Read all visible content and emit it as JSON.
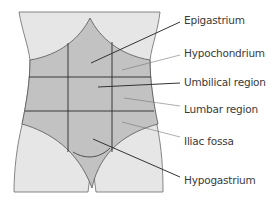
{
  "diagram": {
    "colors": {
      "background": "#ffffff",
      "body_fill": "#e6e6e6",
      "region_fill": "#c2c2c2",
      "outline": "#555555",
      "grid_line": "#2a2a2a",
      "leader_line": "#333333",
      "label_text": "#3a3a3a"
    },
    "labels": [
      {
        "id": "epigastrium",
        "text": "Epigastrium"
      },
      {
        "id": "hypochondrium",
        "text": "Hypochondrium"
      },
      {
        "id": "umbilical",
        "text": "Umbilical region"
      },
      {
        "id": "lumbar",
        "text": "Lumbar region"
      },
      {
        "id": "iliac",
        "text": "Iliac fossa"
      },
      {
        "id": "hypogastrium",
        "text": "Hypogastrium"
      }
    ]
  }
}
